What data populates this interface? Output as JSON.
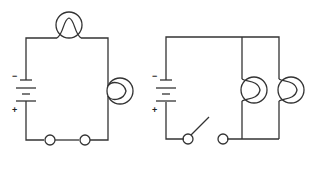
{
  "diagram": {
    "type": "electric-circuits",
    "stroke_color": "#333333",
    "background": "#ffffff",
    "circuits": [
      {
        "name": "series-circuit",
        "components": [
          "battery",
          "bulb-top",
          "bulb-right",
          "terminal-left",
          "terminal-right"
        ],
        "battery_labels": {
          "negative": "−",
          "positive": "+"
        }
      },
      {
        "name": "parallel-circuit",
        "components": [
          "battery",
          "open-switch",
          "bulb-parallel-1",
          "bulb-parallel-2"
        ],
        "battery_labels": {
          "negative": "−",
          "positive": "+"
        }
      }
    ]
  }
}
